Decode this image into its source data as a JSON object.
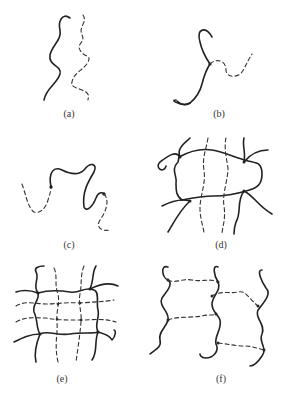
{
  "figure": {
    "panels": [
      {
        "id": "a",
        "label": "(a)",
        "description": "two separate chains, one solid one dashed, side by side"
      },
      {
        "id": "b",
        "label": "(b)",
        "description": "solid chain with dashed branch grafted at a junction"
      },
      {
        "id": "c",
        "label": "(c)",
        "description": "solid chain segment flanked by dashed segments at both ends (block)"
      },
      {
        "id": "d",
        "label": "(d)",
        "description": "solid crosslinked network with interpenetrating dashed chains"
      },
      {
        "id": "e",
        "label": "(e)",
        "description": "two interpenetrating crosslinked networks, solid and dashed"
      },
      {
        "id": "f",
        "label": "(f)",
        "description": "solid chains joined by dashed crosslinks"
      }
    ],
    "legend": {
      "solid_line": "polymer A",
      "dashed_line": "polymer B"
    },
    "colors": {
      "line": "#222222",
      "background": "#ffffff"
    }
  }
}
